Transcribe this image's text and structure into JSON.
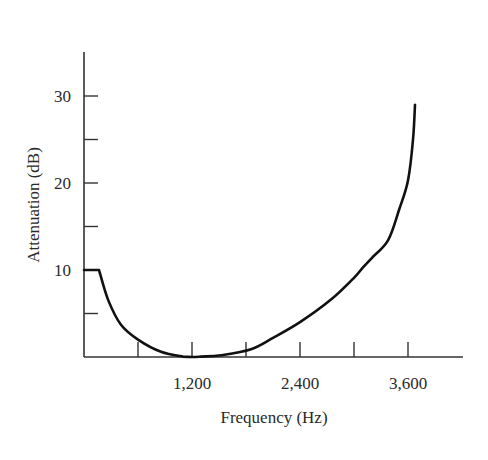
{
  "chart_data": {
    "type": "line",
    "title": "",
    "xlabel": "Frequency (Hz)",
    "ylabel": "Attenuation (dB)",
    "xlim": [
      0,
      4000
    ],
    "ylim": [
      0,
      35
    ],
    "grid": false,
    "legend": null,
    "x_ticks": [
      600,
      1200,
      1800,
      2400,
      3000,
      3600
    ],
    "x_tick_labels": [
      "",
      "1,200",
      "",
      "2,400",
      "",
      "3,600"
    ],
    "y_ticks": [
      5,
      10,
      15,
      20,
      25,
      30
    ],
    "y_tick_labels": [
      "",
      "10",
      "",
      "20",
      "",
      "30"
    ],
    "series": [
      {
        "name": "Attenuation",
        "x": [
          0,
          167,
          267,
          411,
          600,
          856,
          1100,
          1200,
          1300,
          1522,
          1856,
          2100,
          2400,
          2744,
          3000,
          3100,
          3200,
          3378,
          3500,
          3600,
          3656,
          3678
        ],
        "y": [
          10,
          10,
          6.6,
          3.7,
          2.0,
          0.6,
          0.05,
          0,
          0.05,
          0.2,
          0.9,
          2.2,
          4.0,
          6.6,
          9.1,
          10.3,
          11.4,
          13.4,
          16.9,
          20.3,
          25.0,
          29.0
        ]
      }
    ],
    "colors": {
      "line": "#111111",
      "axis": "#333333",
      "text": "#2a2a2a"
    }
  }
}
